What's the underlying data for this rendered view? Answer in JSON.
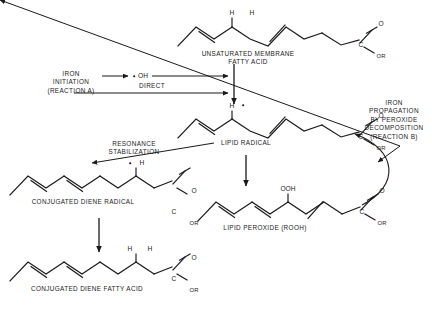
{
  "figure": {
    "type": "biochemical-pathway-diagram",
    "background_color": "#ffffff",
    "ink_color": "#1a1a1a"
  },
  "labels": {
    "unsaturated_fatty_acid": "UNSATURATED MEMBRANE\nFATTY ACID",
    "iron_initiation": "IRON\nINITIATION\n(REACTION A)",
    "hydroxyl_radical": "OH",
    "direct": "DIRECT",
    "lipid_radical": "LIPID RADICAL",
    "iron_propagation": "IRON\nPROPAGATION\nBY PEROXIDE\nDECOMPOSITION\n(REACTION B)",
    "resonance_stabilization": "RESONANCE\nSTABILIZATION",
    "conjugated_diene_radical": "CONJUGATED DIENE RADICAL",
    "lipid_peroxide": "LIPID PEROXIDE (ROOH)",
    "conjugated_diene_fatty_acid": "CONJUGATED DIENE FATTY ACID"
  },
  "atoms": {
    "h": "H",
    "o": "O",
    "c": "C",
    "or": "OR",
    "ooh": "OOH"
  },
  "molecules": [
    {
      "id": "unsaturated-membrane-fatty-acid",
      "name": "UNSATURATED MEMBRANE FATTY ACID",
      "hydrogens": 2,
      "double_bonds": 2,
      "terminal_group": "C(=O)OR"
    },
    {
      "id": "lipid-radical",
      "name": "LIPID RADICAL",
      "hydrogens": 1,
      "radical": true,
      "double_bonds": 2,
      "terminal_group": "C(=O)OR"
    },
    {
      "id": "conjugated-diene-radical",
      "name": "CONJUGATED DIENE RADICAL",
      "hydrogens": 1,
      "radical": true,
      "double_bonds": 2,
      "conjugated": true,
      "terminal_group": "C(=O)OR"
    },
    {
      "id": "lipid-peroxide",
      "name": "LIPID PEROXIDE (ROOH)",
      "substituent": "OOH",
      "double_bonds": 2,
      "conjugated": true,
      "terminal_group": "C(=O)OR"
    },
    {
      "id": "conjugated-diene-fatty-acid",
      "name": "CONJUGATED DIENE FATTY ACID",
      "hydrogens": 2,
      "double_bonds": 2,
      "conjugated": true,
      "terminal_group": "C(=O)OR"
    }
  ],
  "arrows": [
    {
      "id": "iron-to-hydroxyl",
      "label": "",
      "direction": "right"
    },
    {
      "id": "hydroxyl-to-fatty-acid",
      "label": "",
      "direction": "right"
    },
    {
      "id": "direct-to-fatty-acid",
      "label": "DIRECT",
      "direction": "right"
    },
    {
      "id": "fatty-acid-to-lipid-radical",
      "label": "",
      "direction": "down"
    },
    {
      "id": "lipid-radical-to-conjugated-diene-radical",
      "label": "RESONANCE STABILIZATION",
      "direction": "left"
    },
    {
      "id": "conjugated-diene-radical-to-fatty-acid",
      "label": "",
      "direction": "down"
    },
    {
      "id": "lipid-radical-to-lipid-peroxide",
      "label": "",
      "direction": "down"
    },
    {
      "id": "peroxide-recycle-curve",
      "label": "",
      "direction": "curve-up"
    },
    {
      "id": "iron-propagation-pointer",
      "label": "IRON PROPAGATION BY PEROXIDE DECOMPOSITION (REACTION B)",
      "direction": "down-left"
    }
  ]
}
